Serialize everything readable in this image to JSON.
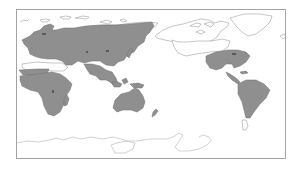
{
  "map": {
    "projection": "equirectangular, Pacific-centered",
    "frame": {
      "x": 16,
      "y": 9,
      "width": 270,
      "height": 150
    },
    "colors": {
      "background": "#ffffff",
      "frame": "#9a9a9a",
      "land_outline": "#8c8c8c",
      "distribution_fill": "#8f8f8f",
      "distribution_outline": "#6e6e6e"
    },
    "legend": null,
    "distribution_regions": [
      {
        "name": "Europe and temperate Asia",
        "shaded": true
      },
      {
        "name": "North Africa strip (northwest)",
        "shaded": true
      },
      {
        "name": "Sub-Saharan Africa",
        "shaded": true
      },
      {
        "name": "Madagascar",
        "shaded": true
      },
      {
        "name": "South and Southeast Asia",
        "shaded": true
      },
      {
        "name": "Japan",
        "shaded": true
      },
      {
        "name": "Maritime Southeast Asia / New Guinea",
        "shaded": true
      },
      {
        "name": "Australia",
        "shaded": true
      },
      {
        "name": "New Zealand",
        "shaded": true
      },
      {
        "name": "Eastern North America and Mexico",
        "shaded": true
      },
      {
        "name": "Central America and Caribbean",
        "shaded": true
      },
      {
        "name": "South America (north and central)",
        "shaded": true
      }
    ],
    "unshaded_regions": [
      "Arctic North America and Greenland",
      "Arctic Eurasia",
      "Sahara and Arabian Peninsula",
      "Western North America",
      "Southern South America",
      "Antarctica"
    ]
  }
}
